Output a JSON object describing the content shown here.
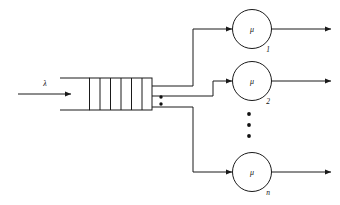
{
  "diagram": {
    "type": "queueing-network",
    "colors": {
      "stroke": "#1a1a1a",
      "text": "#111111",
      "background": "#ffffff"
    },
    "arrival": {
      "label": "λ",
      "icon": "arrow-right-icon"
    },
    "queue": {
      "name": "waiting-line",
      "slot_count": 6,
      "divider_count": 5,
      "open_end": true
    },
    "ellipsis": {
      "queue_branches": "⋮",
      "queue_branch_dot_count": 2,
      "servers": "⋮",
      "server_dot_count": 3
    },
    "servers": [
      {
        "name": "server-1",
        "symbol": "μ",
        "subscript": "1",
        "departure_icon": "arrow-right-icon"
      },
      {
        "name": "server-2",
        "symbol": "μ",
        "subscript": "2",
        "departure_icon": "arrow-right-icon"
      },
      {
        "name": "server-n",
        "symbol": "μ",
        "subscript": "n",
        "departure_icon": "arrow-right-icon"
      }
    ]
  }
}
